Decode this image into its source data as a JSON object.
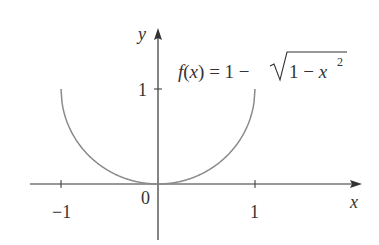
{
  "chart_data": {
    "type": "line",
    "title": "",
    "function_label": "f(x) = 1 − √(1 − x²)",
    "xlabel": "x",
    "ylabel": "y",
    "x_ticks": [
      {
        "value": -1,
        "label": "−1"
      },
      {
        "value": 1,
        "label": "1"
      }
    ],
    "y_ticks": [
      {
        "value": 1,
        "label": "1"
      }
    ],
    "origin_label": "0",
    "xlim": [
      -1.3,
      2.1
    ],
    "ylim": [
      -0.6,
      1.6
    ],
    "domain": [
      -1,
      1
    ],
    "series": [
      {
        "name": "f(x) = 1 − √(1 − x²)",
        "x": [
          -1,
          -0.9,
          -0.8,
          -0.7,
          -0.6,
          -0.5,
          -0.4,
          -0.3,
          -0.2,
          -0.1,
          0,
          0.1,
          0.2,
          0.3,
          0.4,
          0.5,
          0.6,
          0.7,
          0.8,
          0.9,
          1
        ],
        "y": [
          1,
          0.564,
          0.4,
          0.286,
          0.2,
          0.134,
          0.083,
          0.046,
          0.02,
          0.005,
          0,
          0.005,
          0.02,
          0.046,
          0.083,
          0.134,
          0.2,
          0.286,
          0.4,
          0.564,
          1
        ]
      }
    ],
    "grid": false,
    "legend": "none",
    "colors": {
      "curve": "#8a8a8a",
      "axes": "#333333"
    }
  },
  "labels": {
    "f": "f",
    "paren_open": "(",
    "x_var": "x",
    "paren_close": ")",
    "eq": " = 1 − ",
    "radicand_one": "1 − ",
    "radicand_x": "x",
    "exponent": "2",
    "x_axis": "x",
    "y_axis": "y",
    "origin": "0",
    "xtick_neg1": "−1",
    "xtick_1": "1",
    "ytick_1": "1"
  }
}
